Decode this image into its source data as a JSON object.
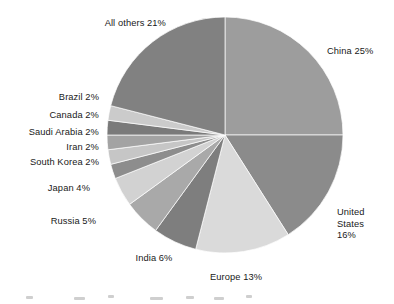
{
  "chart_data": {
    "type": "pie",
    "title": "",
    "subtitle": "",
    "xlabel": "",
    "ylabel": "",
    "legend_position": "none",
    "labels_position": "outside",
    "start_angle_deg": 0,
    "direction": "clockwise",
    "value_unit": "%",
    "categories": [
      "China",
      "United States",
      "Europe",
      "India",
      "Russia",
      "Japan",
      "South Korea",
      "Iran",
      "Saudi Arabia",
      "Canada",
      "Brazil",
      "All others"
    ],
    "values": [
      25,
      16,
      13,
      6,
      5,
      4,
      2,
      2,
      2,
      2,
      2,
      21
    ],
    "slices": [
      {
        "name": "china",
        "label": "China 25%",
        "category": "China",
        "value": 25,
        "value_text": "25%",
        "color": "#9d9d9d"
      },
      {
        "name": "united-states",
        "label": "United States 16%",
        "label_lines": [
          "United",
          "States",
          "16%"
        ],
        "category": "United States",
        "value": 16,
        "value_text": "16%",
        "color": "#8b8b8b"
      },
      {
        "name": "europe",
        "label": "Europe 13%",
        "category": "Europe",
        "value": 13,
        "value_text": "13%",
        "color": "#dadada"
      },
      {
        "name": "india",
        "label": "India 6%",
        "category": "India",
        "value": 6,
        "value_text": "6%",
        "color": "#7e7e7e"
      },
      {
        "name": "russia",
        "label": "Russia 5%",
        "category": "Russia",
        "value": 5,
        "value_text": "5%",
        "color": "#a9a9a9"
      },
      {
        "name": "japan",
        "label": "Japan 4%",
        "category": "Japan",
        "value": 4,
        "value_text": "4%",
        "color": "#d2d2d2"
      },
      {
        "name": "south-korea",
        "label": "South Korea 2%",
        "category": "South Korea",
        "value": 2,
        "value_text": "2%",
        "color": "#8d8d8d"
      },
      {
        "name": "iran",
        "label": "Iran 2%",
        "category": "Iran",
        "value": 2,
        "value_text": "2%",
        "color": "#c6c6c6"
      },
      {
        "name": "saudi-arabia",
        "label": "Saudi Arabia 2%",
        "category": "Saudi Arabia",
        "value": 2,
        "value_text": "2%",
        "color": "#a3a3a3"
      },
      {
        "name": "canada",
        "label": "Canada 2%",
        "category": "Canada",
        "value": 2,
        "value_text": "2%",
        "color": "#7a7a7a"
      },
      {
        "name": "brazil",
        "label": "Brazil 2%",
        "category": "Brazil",
        "value": 2,
        "value_text": "2%",
        "color": "#cbcbcb"
      },
      {
        "name": "all-others",
        "label": "All others 21%",
        "category": "All others",
        "value": 21,
        "value_text": "21%",
        "color": "#818181"
      }
    ],
    "geometry": {
      "center_x": 225,
      "center_y": 135,
      "radius": 118
    },
    "background_color": "#ffffff",
    "label_color": "#191919"
  }
}
